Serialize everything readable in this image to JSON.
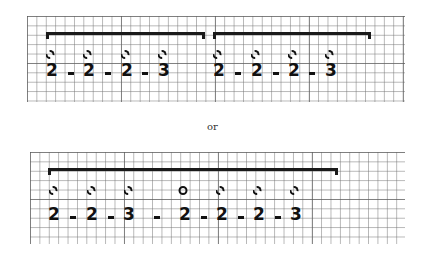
{
  "separator_text": "or",
  "systems": [
    {
      "name": "top-system",
      "grid": {
        "left": 27,
        "top": 16,
        "width": 378,
        "height": 86
      },
      "brackets": [
        {
          "left": 46,
          "width": 159,
          "top": 32
        },
        {
          "left": 213,
          "width": 158,
          "top": 32
        }
      ],
      "notes_y": 50,
      "counts_y": 62,
      "dashes_y": 72,
      "notes": [
        {
          "x": 50,
          "style": "dashed"
        },
        {
          "x": 87,
          "style": "dashed"
        },
        {
          "x": 125,
          "style": "dashed"
        },
        {
          "x": 162,
          "style": "dashed"
        },
        {
          "x": 217,
          "style": "dashed"
        },
        {
          "x": 255,
          "style": "dashed"
        },
        {
          "x": 292,
          "style": "dashed"
        },
        {
          "x": 329,
          "style": "dashed"
        }
      ],
      "counts": [
        {
          "x": 52,
          "value": "2"
        },
        {
          "x": 89,
          "value": "2"
        },
        {
          "x": 127,
          "value": "2"
        },
        {
          "x": 164,
          "value": "3"
        },
        {
          "x": 219,
          "value": "2"
        },
        {
          "x": 257,
          "value": "2"
        },
        {
          "x": 294,
          "value": "2"
        },
        {
          "x": 331,
          "value": "3"
        }
      ],
      "dashes": [
        71,
        108,
        145,
        238,
        276,
        312
      ]
    },
    {
      "name": "bottom-system",
      "grid": {
        "left": 30,
        "top": 152,
        "width": 375,
        "height": 92
      },
      "brackets": [
        {
          "left": 48,
          "width": 290,
          "top": 168
        }
      ],
      "notes_y": 186,
      "counts_y": 206,
      "dashes_y": 216,
      "notes": [
        {
          "x": 53,
          "style": "dashed"
        },
        {
          "x": 91,
          "style": "dashed"
        },
        {
          "x": 128,
          "style": "dashed"
        },
        {
          "x": 183,
          "style": "solid"
        },
        {
          "x": 220,
          "style": "dashed"
        },
        {
          "x": 257,
          "style": "dashed"
        },
        {
          "x": 294,
          "style": "dashed"
        }
      ],
      "counts": [
        {
          "x": 54,
          "value": "2"
        },
        {
          "x": 92,
          "value": "2"
        },
        {
          "x": 129,
          "value": "3"
        },
        {
          "x": 185,
          "value": "2"
        },
        {
          "x": 222,
          "value": "2"
        },
        {
          "x": 259,
          "value": "2"
        },
        {
          "x": 296,
          "value": "3"
        }
      ],
      "dashes": [
        73,
        111,
        157,
        204,
        241,
        278
      ]
    }
  ]
}
